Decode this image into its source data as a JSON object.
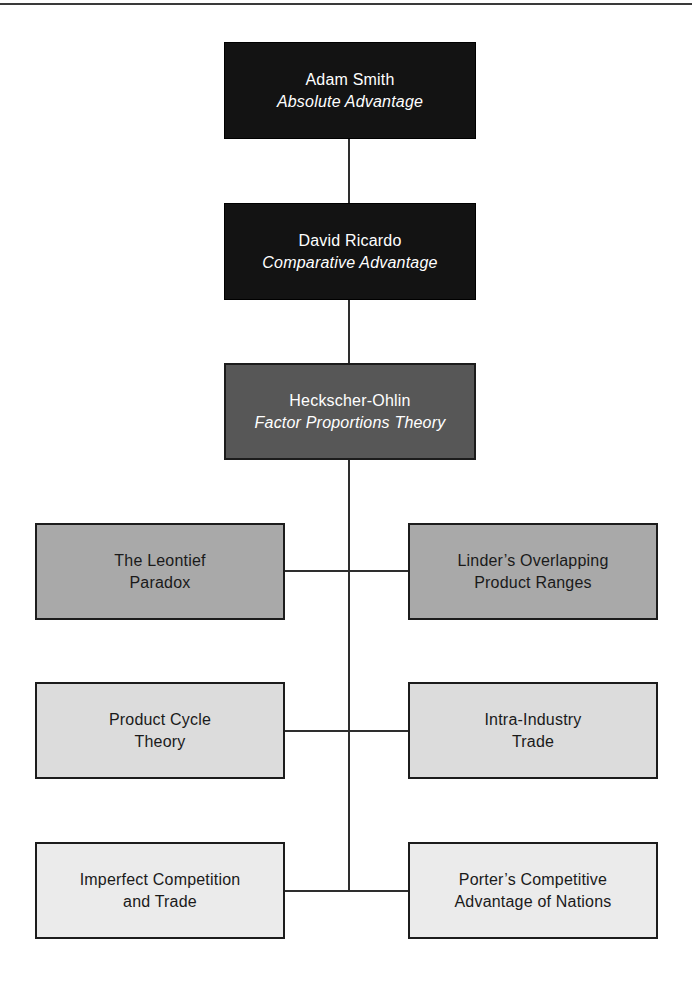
{
  "figure": {
    "nodes": [
      {
        "id": "adam-smith",
        "line1": "Adam Smith",
        "line2": "Absolute Advantage"
      },
      {
        "id": "david-ricardo",
        "line1": "David Ricardo",
        "line2": "Comparative Advantage"
      },
      {
        "id": "heckscher-ohlin",
        "line1": "Heckscher-Ohlin",
        "line2": "Factor Proportions Theory"
      },
      {
        "id": "leontief-paradox",
        "line1": "The Leontief",
        "line2": "Paradox"
      },
      {
        "id": "linder-overlapping",
        "line1": "Linder’s Overlapping",
        "line2": "Product Ranges"
      },
      {
        "id": "product-cycle-theory",
        "line1": "Product Cycle",
        "line2": "Theory"
      },
      {
        "id": "intra-industry-trade",
        "line1": "Intra-Industry",
        "line2": "Trade"
      },
      {
        "id": "imperfect-competition",
        "line1": "Imperfect Competition",
        "line2": "and Trade"
      },
      {
        "id": "porter-competitive",
        "line1": "Porter’s Competitive",
        "line2": "Advantage of Nations"
      }
    ],
    "colors": {
      "node_black": "#131313",
      "node_dark_gray": "#575757",
      "node_mid_gray": "#a9a9a9",
      "node_light_gray": "#dcdcdc",
      "node_lighter_gray": "#ebebeb",
      "node_border": "#1c1c1c",
      "connector_line": "#2e2e2e",
      "top_rule": "#3a3a3a",
      "text_on_dark": "#ffffff",
      "text_on_light": "#1a1a1a"
    }
  }
}
